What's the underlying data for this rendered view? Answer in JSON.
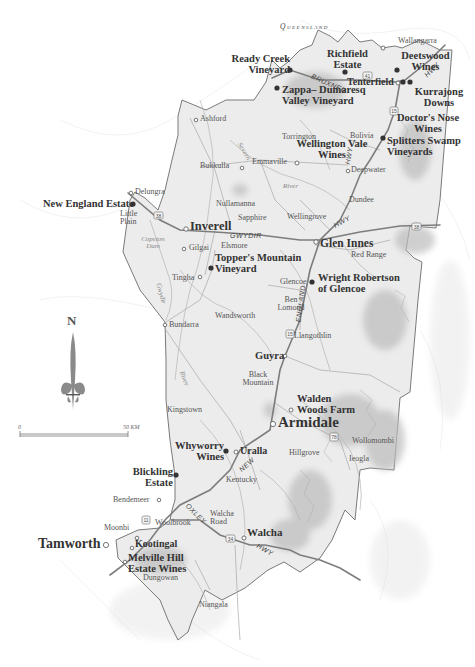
{
  "map": {
    "region_label": "Queensland",
    "north_label": "N",
    "scale": {
      "start": "0",
      "end": "50 KM"
    },
    "colors": {
      "region_fill": "#e9e9e9",
      "border": "#777777",
      "road": "#8a8a8a",
      "text": "#333333",
      "terrain": "#bdbdbd"
    },
    "roads": [
      "BRUXNER",
      "HWY",
      "GWYDIR",
      "HWY",
      "HWY",
      "ENGLAND",
      "NEW",
      "OXLEY",
      "HWY"
    ],
    "road_labels": {
      "bruxner": "BRUXNER",
      "hwy_ne": "HWY",
      "hwy_n": "HWY",
      "hwy_glen": "HWY",
      "gwydir": "GWYDIR",
      "england": "ENGLAND",
      "new": "NEW",
      "oxley": "OXLEY",
      "hwy_walcha": "HWY"
    },
    "route_numbers": {
      "r41": "41",
      "r15a": "15",
      "r38a": "38",
      "r38b": "38",
      "r15b": "15",
      "r78": "78",
      "r11": "11",
      "r34": "34"
    },
    "water": {
      "river1": "River",
      "copeton": "Copeton Dam",
      "gwydir_river": "Gwydir",
      "river2": "River",
      "severn": "Severn"
    },
    "towns": {
      "wallangarra": "Wallangarra",
      "tenterfield": "Tenterfield",
      "ashford": "Ashford",
      "torrington": "Torrington",
      "bolivia": "Bolivia",
      "emmaville": "Emmaville",
      "deepwater": "Deepwater",
      "bukkulla": "Bukkulla",
      "delungra": "Delungra",
      "nullamanna": "Nullamanna",
      "dundee": "Dundee",
      "little_plain": "Little Plain",
      "sapphire": "Sapphire",
      "wellingrove": "Wellingrove",
      "inverell": "Inverell",
      "glen_innes": "Glen Innes",
      "elsmore": "Elsmore",
      "red_range": "Red Range",
      "gilgai": "Gilgai",
      "tingha": "Tingha",
      "glencoe": "Glencoe",
      "ben_lomond": "Ben Lomond",
      "bundarra": "Bundarra",
      "wandsworth": "Wandsworth",
      "llangothlin": "Llangothlin",
      "guyra": "Guyra",
      "black_mountain": "Black Mountain",
      "kingstown": "Kingstown",
      "armidale": "Armidale",
      "wollomombi": "Wollomombi",
      "uralla": "Uralla",
      "hillgrove": "Hillgrove",
      "ieogla": "Ieogla",
      "kentucky": "Kentucky",
      "bendemeer": "Bendemeer",
      "walcha_road": "Walcha Road",
      "woolbrook": "Woolbrook",
      "moonbi": "Moonbi",
      "walcha": "Walcha",
      "tamworth": "Tamworth",
      "kootingal": "Kootingal",
      "dungowan": "Dungowan",
      "niangala": "Niangala"
    },
    "wineries": {
      "ready_creek": "Ready Creek Vineyard",
      "richfield": "Richfield Estate",
      "deetswood": "Deetswood Wines",
      "zappa": "Zappa– Dumaresq Valley Vineyard",
      "kurrajong": "Kurrajong Downs",
      "doctors_nose": "Doctor's Nose Wines",
      "wellington_vale": "Wellington Vale Wines",
      "splitters": "Splitters Swamp Vineyards",
      "new_england": "New England Estate",
      "toppers": "Topper's Mountain Vineyard",
      "wright_robertson": "Wright Robertson of Glencoe",
      "walden_woods": "Walden Woods Farm",
      "whyworry": "Whyworry Wines",
      "blickling": "Blickling Estate",
      "melville_hill": "Melville Hill Estate Wines"
    }
  }
}
